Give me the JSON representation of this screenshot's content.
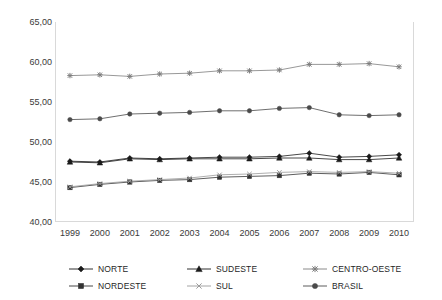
{
  "chart_data": {
    "type": "line",
    "title": "",
    "xlabel": "",
    "ylabel": "",
    "categories": [
      "1999",
      "2000",
      "2001",
      "2002",
      "2003",
      "2004",
      "2005",
      "2006",
      "2007",
      "2008",
      "2009",
      "2010"
    ],
    "ylim": [
      40.0,
      65.0
    ],
    "ytick_labels": [
      "65,00",
      "60,00",
      "55,00",
      "50,00",
      "45,00",
      "40,00"
    ],
    "ytick_values": [
      65.0,
      60.0,
      55.0,
      50.0,
      45.0,
      40.0
    ],
    "grid": false,
    "legend_position": "bottom",
    "decimal_separator": ",",
    "series": [
      {
        "name": "NORTE",
        "marker": "diamond",
        "color": "#1a1a1a",
        "values": [
          47.6,
          47.5,
          48.0,
          47.9,
          48.0,
          48.1,
          48.1,
          48.2,
          48.6,
          48.1,
          48.2,
          48.4
        ]
      },
      {
        "name": "NORDESTE",
        "marker": "square",
        "color": "#333333",
        "values": [
          44.3,
          44.7,
          45.0,
          45.2,
          45.3,
          45.6,
          45.7,
          45.8,
          46.1,
          46.0,
          46.2,
          45.9
        ]
      },
      {
        "name": "SUDESTE",
        "marker": "triangle",
        "color": "#1a1a1a",
        "values": [
          47.5,
          47.4,
          47.9,
          47.8,
          47.9,
          47.9,
          47.9,
          48.0,
          48.0,
          47.8,
          47.8,
          48.0
        ]
      },
      {
        "name": "SUL",
        "marker": "cross",
        "color": "#9a9a9a",
        "values": [
          44.4,
          44.8,
          45.1,
          45.3,
          45.5,
          45.9,
          46.0,
          46.2,
          46.3,
          46.2,
          46.3,
          46.1
        ]
      },
      {
        "name": "CENTRO-OESTE",
        "marker": "asterisk",
        "color": "#7d7d7d",
        "values": [
          58.3,
          58.4,
          58.2,
          58.5,
          58.6,
          58.9,
          58.9,
          59.0,
          59.7,
          59.7,
          59.8,
          59.4
        ]
      },
      {
        "name": "BRASIL",
        "marker": "circle",
        "color": "#4a4a4a",
        "values": [
          52.8,
          52.9,
          53.5,
          53.6,
          53.7,
          53.9,
          53.9,
          54.2,
          54.3,
          53.4,
          53.3,
          53.4
        ]
      }
    ]
  },
  "legend": {
    "entries": [
      {
        "label": "NORTE"
      },
      {
        "label": "SUDESTE"
      },
      {
        "label": "CENTRO-OESTE"
      },
      {
        "label": "NORDESTE"
      },
      {
        "label": "SUL"
      },
      {
        "label": "BRASIL"
      }
    ]
  },
  "cropped_title": ""
}
